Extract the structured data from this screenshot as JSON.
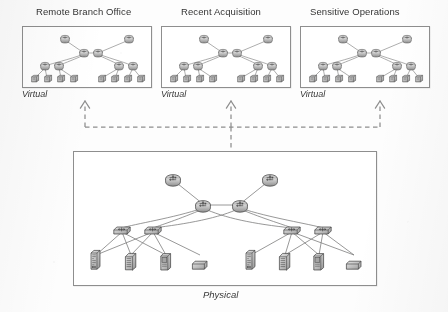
{
  "figure": {
    "kind": "network-topology-diagram",
    "layers": [
      "Virtual",
      "Physical"
    ]
  },
  "virtual_panels": [
    {
      "title": "Remote Branch Office",
      "layer_label": "Virtual"
    },
    {
      "title": "Recent Acquisition",
      "layer_label": "Virtual"
    },
    {
      "title": "Sensitive Operations",
      "layer_label": "Virtual"
    }
  ],
  "physical_panel": {
    "layer_label": "Physical"
  },
  "topology": {
    "virtual": {
      "tiers": [
        "edge-router",
        "core-router",
        "aggregation-switch",
        "host"
      ],
      "counts": {
        "edge-router": 2,
        "core-router": 2,
        "aggregation-switch": 4,
        "host": 8
      }
    },
    "physical": {
      "tiers": [
        "edge-router",
        "core-router",
        "aggregation-switch",
        "server"
      ],
      "counts": {
        "edge-router": 2,
        "core-router": 2,
        "aggregation-switch": 4,
        "server": 8
      },
      "server_types": [
        "tower-server",
        "blade-chassis",
        "desktop-workstation",
        "flat-appliance"
      ]
    }
  },
  "mapping_connector": {
    "style": "dashed",
    "direction": "physical-to-virtual",
    "arrow_count": 3
  },
  "colors": {
    "ink": "#2e2e2e",
    "line": "#8a8a8a",
    "panel_border": "#8e8e8e",
    "node_fill": "#b4b4b4",
    "node_stroke": "#4a4a4a",
    "paper": "#fbfbfa"
  }
}
